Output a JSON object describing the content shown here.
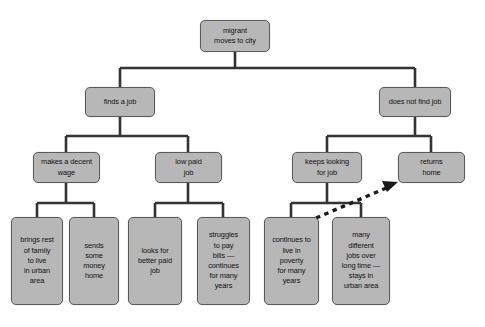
{
  "diagram": {
    "colors": {
      "box_fill": "#b7b7b7",
      "box_border": "#5a5a5a",
      "connector": "#333333",
      "background": "#ffffff",
      "text": "#111111",
      "dashed_arrow": "#1a1a1a"
    },
    "nodes": {
      "root": "migrant\nmoves to city",
      "finds_job": "finds a job",
      "not_find_job": "does not find job",
      "decent_wage": "makes a decent\nwage",
      "low_paid": "low paid\njob",
      "keeps_looking": "keeps looking\nfor job",
      "returns_home": "returns\nhome",
      "brings_family": "brings rest\nof family\nto live\nin urban\narea",
      "sends_money": "sends\nsome\nmoney\nhome",
      "looks_better": "looks for\nbetter paid\njob",
      "struggles": "struggles\nto pay\nbills —\ncontinues\nfor many\nyears",
      "poverty": "continues to\nlive in\npoverty\nfor many\nyears",
      "many_jobs": "many\ndifferent\njobs over\nlong time —\nstays in\nurban area"
    }
  }
}
